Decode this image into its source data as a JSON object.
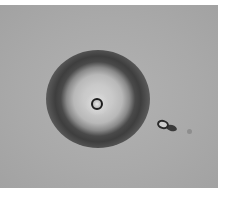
{
  "image": {
    "description": "Phase-contrast microscopy image of a spherical particle surrounded by a dark halo ring, with small debris to the right",
    "background_color": "#a9a9a9",
    "halo_color": "#3e3e3e",
    "margin_color": "#ffffff"
  }
}
